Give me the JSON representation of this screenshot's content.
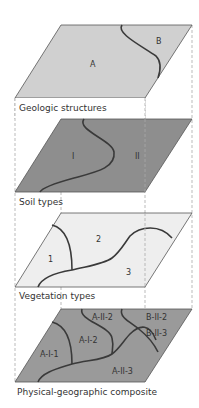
{
  "colors": {
    "geologic_fill": "#d0d0d0",
    "soil_fill": "#8e8e8e",
    "vegetation_fill": "#eeeeee",
    "composite_fill": "#9a9a9a",
    "boundary_line": "#3a3a3a",
    "edge_line": "#555555",
    "dash_line": "#aaaaaa"
  },
  "layers": [
    {
      "label": "Geologic structures",
      "regions": [
        "A",
        "B"
      ]
    },
    {
      "label": "Soil types",
      "regions": [
        "I",
        "II"
      ]
    },
    {
      "label": "Vegetation types",
      "regions": [
        "1",
        "2",
        "3"
      ]
    },
    {
      "label": "Physical-geographic composite",
      "regions": [
        "A-I-1",
        "A-I-2",
        "A-II-2",
        "B-II-2",
        "B-II-3",
        "A-II-3"
      ]
    }
  ]
}
